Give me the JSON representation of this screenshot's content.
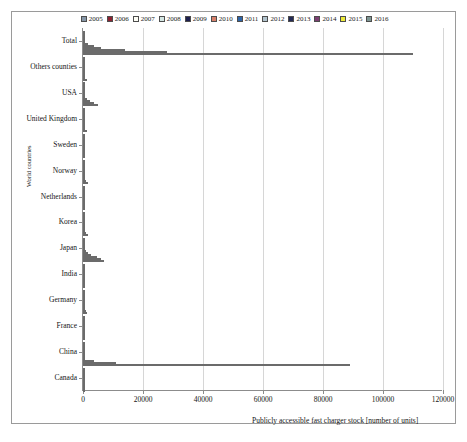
{
  "figure": {
    "x_axis_title": "Publicly accessible fast charger stock [number of units]",
    "y_axis_title": "World countries"
  },
  "chart_data": {
    "type": "bar",
    "orientation": "horizontal",
    "title": "",
    "xlabel": "Publicly accessible fast charger stock [number of units]",
    "ylabel": "World countries",
    "xlim": [
      0,
      120000
    ],
    "xticks": [
      0,
      20000,
      40000,
      60000,
      80000,
      100000,
      120000
    ],
    "xtick_labels": [
      "0",
      "20000",
      "40000",
      "60000",
      "80000",
      "100000",
      "120000"
    ],
    "grid": true,
    "legend_position": "top",
    "categories": [
      "Total",
      "Others counties",
      "USA",
      "United Kingdom",
      "Sweden",
      "Norway",
      "Netherlands",
      "Korea",
      "Japan",
      "India",
      "Germany",
      "France",
      "China",
      "Canada"
    ],
    "series": [
      {
        "name": "2005",
        "color": "#8697a8",
        "values": [
          20,
          0,
          0,
          0,
          0,
          0,
          0,
          0,
          20,
          0,
          0,
          0,
          0,
          0
        ]
      },
      {
        "name": "2006",
        "color": "#8d2232",
        "values": [
          30,
          0,
          0,
          0,
          0,
          0,
          0,
          0,
          30,
          0,
          0,
          0,
          0,
          0
        ]
      },
      {
        "name": "2007",
        "color": "#fdfdf5",
        "values": [
          40,
          0,
          0,
          0,
          0,
          0,
          0,
          0,
          40,
          0,
          0,
          0,
          0,
          0
        ]
      },
      {
        "name": "2008",
        "color": "#d4e7e4",
        "values": [
          60,
          0,
          0,
          0,
          0,
          0,
          0,
          0,
          60,
          0,
          0,
          0,
          0,
          0
        ]
      },
      {
        "name": "2009",
        "color": "#1d1f4e",
        "values": [
          200,
          0,
          10,
          0,
          0,
          0,
          0,
          0,
          190,
          0,
          0,
          0,
          0,
          0
        ]
      },
      {
        "name": "2010",
        "color": "#d8806a",
        "values": [
          700,
          20,
          80,
          10,
          10,
          20,
          10,
          10,
          500,
          0,
          20,
          10,
          30,
          10
        ]
      },
      {
        "name": "2011",
        "color": "#2d64a8",
        "values": [
          1800,
          60,
          300,
          30,
          40,
          100,
          40,
          40,
          1000,
          0,
          60,
          30,
          100,
          40
        ]
      },
      {
        "name": "2012",
        "color": "#b2c4ce",
        "values": [
          3500,
          120,
          700,
          80,
          120,
          240,
          90,
          90,
          1700,
          0,
          140,
          70,
          200,
          80
        ]
      },
      {
        "name": "2013",
        "color": "#232a55",
        "values": [
          6000,
          220,
          1300,
          200,
          220,
          400,
          170,
          200,
          2600,
          0,
          280,
          140,
          500,
          150
        ]
      },
      {
        "name": "2014",
        "color": "#7b3f72",
        "values": [
          14000,
          500,
          2300,
          450,
          400,
          700,
          330,
          500,
          4500,
          0,
          560,
          300,
          3800,
          300
        ]
      },
      {
        "name": "2015",
        "color": "#eeeb3a",
        "values": [
          28000,
          800,
          3500,
          800,
          600,
          1100,
          500,
          900,
          5900,
          0,
          880,
          500,
          11000,
          500
        ]
      },
      {
        "name": "2016",
        "color": "#7e9694",
        "values": [
          110000,
          1200,
          5000,
          1200,
          800,
          1500,
          700,
          1500,
          7000,
          10,
          1200,
          800,
          89000,
          700
        ]
      }
    ]
  },
  "legend": {
    "items": [
      {
        "label": "2005",
        "color": "#8697a8"
      },
      {
        "label": "2006",
        "color": "#8d2232"
      },
      {
        "label": "2007",
        "color": "#fdfdf5"
      },
      {
        "label": "2008",
        "color": "#d4e7e4"
      },
      {
        "label": "2009",
        "color": "#1d1f4e"
      },
      {
        "label": "2010",
        "color": "#d8806a"
      },
      {
        "label": "2011",
        "color": "#2d64a8"
      },
      {
        "label": "2012",
        "color": "#b2c4ce"
      },
      {
        "label": "2013",
        "color": "#232a55"
      },
      {
        "label": "2014",
        "color": "#7b3f72"
      },
      {
        "label": "2015",
        "color": "#eeeb3a"
      },
      {
        "label": "2016",
        "color": "#7e9694"
      }
    ]
  }
}
